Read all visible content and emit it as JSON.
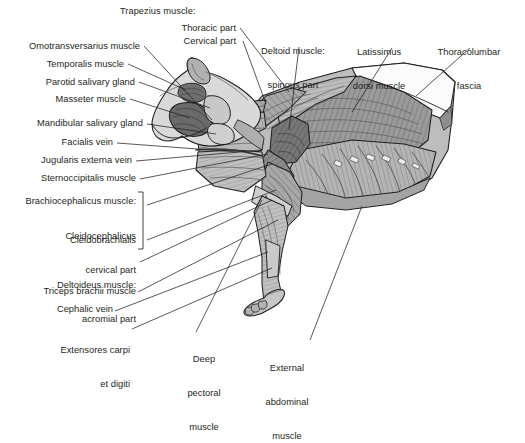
{
  "figure": {
    "view": "left lateral",
    "background_color": "#ffffff",
    "line_color": "#231f20",
    "palette": {
      "outline": "#231f20",
      "skin_light": "#d9d9d9",
      "fascia_white": "#ffffff",
      "muscle_light": "#c3c3c3",
      "muscle_mid": "#9a9a9a",
      "muscle_dark": "#6e6e6e",
      "muscle_darker": "#575757",
      "shadow": "#4a4a4a"
    },
    "labels": [
      {
        "id": "trapezius-group",
        "text": "Trapezius muscle:",
        "lines": [
          "Trapezius muscle:"
        ],
        "align": "left",
        "x": 120,
        "y": 8,
        "leader": false
      },
      {
        "id": "trapezius-thoracic",
        "text": "Thoracic part",
        "lines": [
          "Thoracic part"
        ],
        "align": "right",
        "x": 173,
        "y": 25,
        "leader": true
      },
      {
        "id": "trapezius-cervical",
        "text": "Cervical part",
        "lines": [
          "Cervical part"
        ],
        "align": "right",
        "x": 176,
        "y": 37,
        "leader": true
      },
      {
        "id": "deltoid-spinous",
        "text": "Deltoid muscle: spinous part",
        "lines": [
          "Deltoid muscle:",
          "spinous part"
        ],
        "align": "center",
        "x": 276,
        "y": 25,
        "leader": true
      },
      {
        "id": "latissimus-dorsi",
        "text": "Latissimus dorsi muscle",
        "lines": [
          "Latissimus",
          "dorsi muscle"
        ],
        "align": "center",
        "x": 378,
        "y": 26,
        "leader": true
      },
      {
        "id": "thoracolumbar-fascia",
        "text": "Thoracolumbar fascia",
        "lines": [
          "Thoracolumbar",
          "fascia"
        ],
        "align": "center",
        "x": 452,
        "y": 26,
        "leader": true
      },
      {
        "id": "omotransversarius",
        "text": "Omotransversarius muscle",
        "lines": [
          "Omotransversarius muscle"
        ],
        "align": "right",
        "x": 8,
        "y": 44,
        "leader": true
      },
      {
        "id": "temporalis",
        "text": "Temporalis muscle",
        "lines": [
          "Temporalis muscle"
        ],
        "align": "right",
        "x": 8,
        "y": 62,
        "leader": true
      },
      {
        "id": "parotid-salivary-gland",
        "text": "Parotid salivary gland",
        "lines": [
          "Parotid salivary gland"
        ],
        "align": "right",
        "x": 8,
        "y": 80,
        "leader": true
      },
      {
        "id": "masseter",
        "text": "Masseter muscle",
        "lines": [
          "Masseter muscle"
        ],
        "align": "right",
        "x": 8,
        "y": 97,
        "leader": true
      },
      {
        "id": "mandibular-salivary-gland",
        "text": "Mandibular salivary gland",
        "lines": [
          "Mandibular salivary gland"
        ],
        "align": "right",
        "x": 8,
        "y": 120,
        "leader": true
      },
      {
        "id": "facialis-vein",
        "text": "Facialis vein",
        "lines": [
          "Facialis vein"
        ],
        "align": "right",
        "x": 8,
        "y": 139,
        "leader": true
      },
      {
        "id": "jugularis-externa-vein",
        "text": "Jugularis externa vein",
        "lines": [
          "Jugularis externa vein"
        ],
        "align": "right",
        "x": 8,
        "y": 157,
        "leader": true
      },
      {
        "id": "sternoccipitalis",
        "text": "Sternoccipitalis muscle",
        "lines": [
          "Sternoccipitalis muscle"
        ],
        "align": "right",
        "x": 8,
        "y": 175,
        "leader": true
      },
      {
        "id": "brachiocephalicus",
        "text": "Brachiocephalicus muscle:",
        "lines": [
          "Brachiocephalicus muscle:"
        ],
        "align": "right",
        "x": 8,
        "y": 197,
        "leader": false
      },
      {
        "id": "cleidocephalicus",
        "text": "Cleidocephalicus cervical part",
        "lines": [
          "Cleidocephalicus",
          "cervical part"
        ],
        "align": "right",
        "x": 8,
        "y": 209,
        "leader": false
      },
      {
        "id": "cleidobrachialis",
        "text": "Cleidobrachialis",
        "lines": [
          "Cleidobrachialis"
        ],
        "align": "right",
        "x": 8,
        "y": 237,
        "leader": false
      },
      {
        "id": "deltoideus-acromial",
        "text": "Deltoideus muscle: acromial part",
        "lines": [
          "Deltoideus muscle:",
          "acromial part"
        ],
        "align": "right",
        "x": 8,
        "y": 259,
        "leader": true
      },
      {
        "id": "triceps-brachii",
        "text": "Triceps brachii muscle",
        "lines": [
          "Triceps brachii muscle"
        ],
        "align": "right",
        "x": 8,
        "y": 288,
        "leader": true
      },
      {
        "id": "cephalic-vein",
        "text": "Cephalic vein",
        "lines": [
          "Cephalic vein"
        ],
        "align": "right",
        "x": 8,
        "y": 307,
        "leader": true
      },
      {
        "id": "extensores-carpi",
        "text": "Extensores carpi et digiti",
        "lines": [
          "Extensores carpi",
          "et digiti"
        ],
        "align": "right",
        "x": 8,
        "y": 325,
        "leader": true
      },
      {
        "id": "deep-pectoral",
        "text": "Deep pectoral muscle",
        "lines": [
          "Deep",
          "pectoral",
          "muscle"
        ],
        "align": "center",
        "x": 204,
        "y": 336,
        "leader": true
      },
      {
        "id": "external-abdominal",
        "text": "External abdominal muscle",
        "lines": [
          "External",
          "abdominal",
          "muscle"
        ],
        "align": "center",
        "x": 287,
        "y": 344,
        "leader": true
      }
    ],
    "bracket": {
      "id": "brachiocephalicus-bracket",
      "x": 143,
      "y_top": 192,
      "y_bottom": 249
    },
    "leader_count": 19
  }
}
